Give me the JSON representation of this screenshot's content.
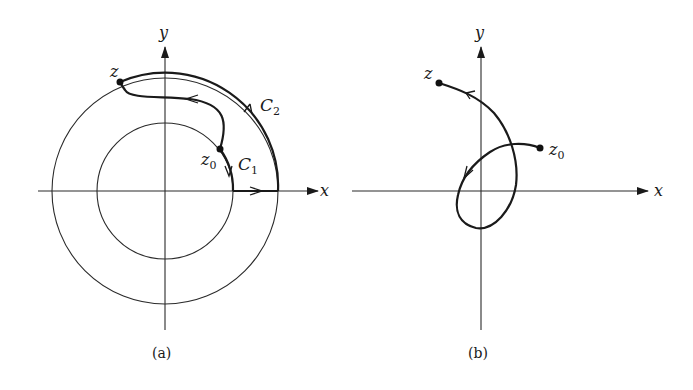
{
  "figure": {
    "panel_a": {
      "caption": "(a)",
      "axis_x_label": "x",
      "axis_y_label": "y",
      "point_z_label": "z",
      "point_z0_label": "z",
      "point_z0_sub": "0",
      "curve_c1_label": "C",
      "curve_c1_sub": "1",
      "curve_c2_label": "C",
      "curve_c2_sub": "2",
      "elements": [
        "inner circle",
        "outer circle",
        "path from z0 to z",
        "contour C1 along inner circle",
        "contour C2 along outer circle"
      ]
    },
    "panel_b": {
      "caption": "(b)",
      "axis_x_label": "x",
      "axis_y_label": "y",
      "point_z_label": "z",
      "point_z0_label": "z",
      "point_z0_sub": "0",
      "elements": [
        "looping path from z0 winding around origin to z"
      ]
    }
  }
}
